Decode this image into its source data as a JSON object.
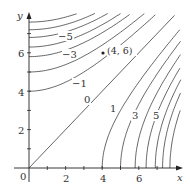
{
  "chart_data": {
    "type": "contour",
    "title": "",
    "xlabel": "x",
    "ylabel": "y",
    "x_ticks": [
      "0",
      "2",
      "4",
      "6"
    ],
    "y_ticks": [
      "2",
      "4",
      "6"
    ],
    "xlim": [
      0,
      8
    ],
    "ylim": [
      0,
      8
    ],
    "grid": false,
    "levels": [
      -7,
      -6,
      -5,
      -4,
      -3,
      -2,
      -1,
      0,
      1,
      2,
      3,
      4,
      5,
      6,
      7
    ],
    "level_labels": [
      "-5",
      "-3",
      "-1",
      "0",
      "1",
      "3",
      "5"
    ],
    "x_axis_crossings": {
      "1": 4.0,
      "2": 5.0,
      "3": 5.8,
      "4": 6.4,
      "5": 6.9,
      "6": 7.3,
      "7": 7.7
    },
    "y_axis_crossings": {
      "-1": 4.0,
      "-2": 5.0,
      "-3": 5.8,
      "-4": 6.3,
      "-5": 6.8,
      "-6": 7.2,
      "-7": 7.6
    },
    "highlighted_point": {
      "x": 4,
      "y": 6,
      "label": "(4, 6)"
    }
  },
  "axes": {
    "x_label": "x",
    "y_label": "y",
    "origin_label": "0",
    "x_tick_labels": [
      "2",
      "4",
      "6"
    ],
    "y_tick_labels": [
      "2",
      "4",
      "6"
    ]
  },
  "labels": {
    "zero": "0",
    "pos1": "1",
    "pos3": "3",
    "pos5": "5",
    "neg1": "−1",
    "neg3": "−3",
    "neg5": "−5",
    "point": "(4, 6)"
  }
}
